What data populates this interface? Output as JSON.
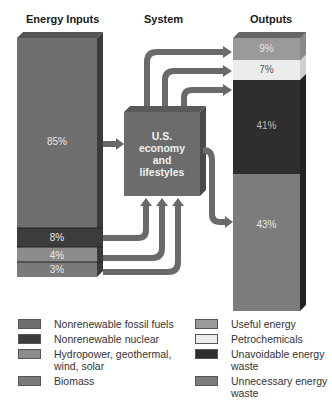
{
  "headers": {
    "inputs": "Energy Inputs",
    "system": "System",
    "outputs": "Outputs"
  },
  "system_box": {
    "line1": "U.S.",
    "line2": "economy",
    "line3": "and",
    "line4": "lifestyles"
  },
  "inputs": [
    {
      "name": "Nonrenewable fossil fuels",
      "value": "85%",
      "color": "#6e6e6e"
    },
    {
      "name": "Nonrenewable nuclear",
      "value": "8%",
      "color": "#3c3c3c"
    },
    {
      "name": "Hydropower, geothermal, wind, solar",
      "value": "4%",
      "color": "#8c8c8c"
    },
    {
      "name": "Biomass",
      "value": "3%",
      "color": "#7a7a7a"
    }
  ],
  "outputs": [
    {
      "name": "Useful energy",
      "value": "9%",
      "color": "#9a9a9a"
    },
    {
      "name": "Petrochemicals",
      "value": "7%",
      "color": "#ececec"
    },
    {
      "name": "Unavoidable energy waste",
      "value": "41%",
      "color": "#2e2e2e"
    },
    {
      "name": "Unnecessary energy waste",
      "value": "43%",
      "color": "#7c7c7c"
    }
  ],
  "legend_left": [
    {
      "label": "Nonrenewable fossil fuels",
      "color": "#6e6e6e"
    },
    {
      "label": "Nonrenewable nuclear",
      "color": "#3c3c3c"
    },
    {
      "label": "Hydropower, geothermal, wind, solar",
      "color": "#8c8c8c"
    },
    {
      "label": "Biomass",
      "color": "#7a7a7a"
    }
  ],
  "legend_right": [
    {
      "label": "Useful energy",
      "color": "#9a9a9a"
    },
    {
      "label": "Petrochemicals",
      "color": "#ececec"
    },
    {
      "label": "Unavoidable energy waste",
      "color": "#2e2e2e"
    },
    {
      "label": "Unnecessary energy waste",
      "color": "#7c7c7c"
    }
  ]
}
